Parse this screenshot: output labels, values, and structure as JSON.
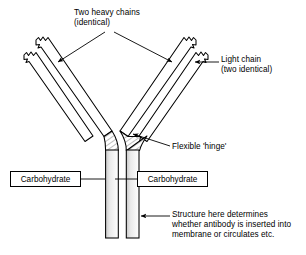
{
  "figure": {
    "background_color": "#ffffff",
    "line_color": "#000000",
    "shade_color": "#d9d9d9"
  },
  "labels": {
    "heavy_chains": {
      "line1": "Two heavy chains",
      "line2": "(identical)"
    },
    "light_chain": {
      "line1": "Light chain",
      "line2": "(two identical)"
    },
    "hinge": {
      "line1": "Flexible 'hinge'"
    },
    "structure": {
      "line1": "Structure here determines",
      "line2": "whether antibody is inserted into",
      "line3": "membrane or circulates etc."
    },
    "carbohydrate_left": "Carbohydrate",
    "carbohydrate_right": "Carbohydrate"
  },
  "parts": {
    "left_arm": "left-antibody-arm",
    "right_arm": "right-antibody-arm",
    "left_stem": "left-constant-region-stem",
    "right_stem": "right-constant-region-stem",
    "left_hinge": "left-flexible-hinge",
    "right_hinge": "right-flexible-hinge"
  }
}
